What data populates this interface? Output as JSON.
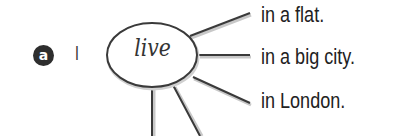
{
  "exercise": {
    "badge_label": "a",
    "subject": "I",
    "verb": "live",
    "branches": [
      {
        "text": "in a flat."
      },
      {
        "text": "in a big city."
      },
      {
        "text": "in London."
      }
    ],
    "empty_branches": 2
  },
  "colors": {
    "badge_bg": "#2e2e2e",
    "line": "#3a3a3a",
    "text": "#222222"
  }
}
